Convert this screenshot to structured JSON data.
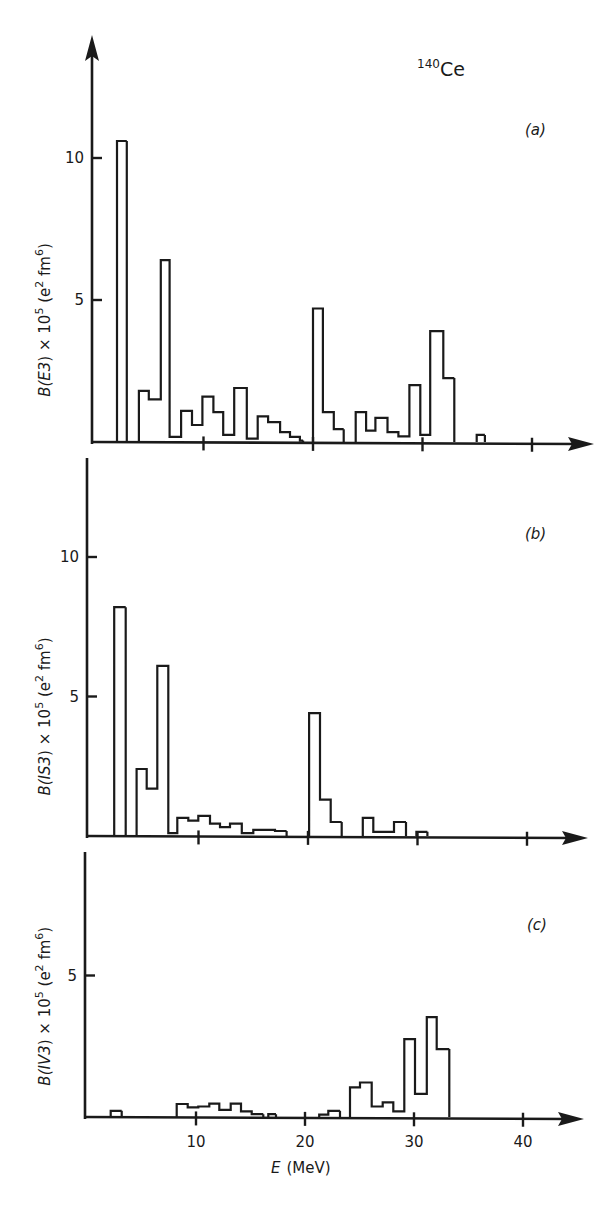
{
  "figure": {
    "nucleus_mass": "140",
    "nucleus_symbol": "Ce",
    "xlabel_symbol": "E",
    "xlabel_unit": "(MeV)",
    "ink_color": "#1a1a1a",
    "background": "#ffffff"
  },
  "chart_data": [
    {
      "type": "bar",
      "subtype": "histogram-step",
      "panel": "(a)",
      "title": "140Ce",
      "ylabel": "B(E3) × 10^5 (e^2 fm^6)",
      "ylabel_parts": {
        "pre": "B(",
        "op": "E3",
        "mid": ") × 10",
        "exp1": "5",
        "post1": " (e",
        "exp2": "2",
        "post2": " fm",
        "exp3": "6",
        "end": ")"
      },
      "xlabel": "E (MeV)",
      "xlim": [
        0,
        45
      ],
      "ylim": [
        0,
        12.5
      ],
      "yticks": [
        5,
        10
      ],
      "xticks": [
        10,
        20,
        30,
        40
      ],
      "xtick_labels_shown": false,
      "layout": {
        "x0": 94,
        "pxPerE": 10.95,
        "y0": 442,
        "pxPerY": 28.4,
        "yTop": 35,
        "xEnd": 594
      },
      "bins": [
        {
          "from": 2.1,
          "to": 3.0,
          "value": 10.6
        },
        {
          "from": 4.1,
          "to": 5.0,
          "value": 1.8
        },
        {
          "from": 5.0,
          "to": 6.1,
          "value": 1.5
        },
        {
          "from": 6.1,
          "to": 6.9,
          "value": 6.4
        },
        {
          "from": 6.9,
          "to": 7.95,
          "value": 0.18
        },
        {
          "from": 7.95,
          "to": 8.95,
          "value": 1.1
        },
        {
          "from": 8.95,
          "to": 9.9,
          "value": 0.6
        },
        {
          "from": 9.9,
          "to": 10.9,
          "value": 1.6
        },
        {
          "from": 10.9,
          "to": 11.8,
          "value": 1.05
        },
        {
          "from": 11.8,
          "to": 12.8,
          "value": 0.25
        },
        {
          "from": 12.8,
          "to": 13.95,
          "value": 1.9
        },
        {
          "from": 13.95,
          "to": 14.95,
          "value": 0.12
        },
        {
          "from": 14.95,
          "to": 15.9,
          "value": 0.9
        },
        {
          "from": 15.9,
          "to": 17.0,
          "value": 0.7
        },
        {
          "from": 17.0,
          "to": 17.9,
          "value": 0.35
        },
        {
          "from": 17.9,
          "to": 18.8,
          "value": 0.18
        },
        {
          "from": 18.8,
          "to": 19.1,
          "value": 0.05
        },
        {
          "from": 20.0,
          "to": 20.9,
          "value": 4.7
        },
        {
          "from": 20.9,
          "to": 21.9,
          "value": 1.05
        },
        {
          "from": 21.9,
          "to": 22.8,
          "value": 0.45
        },
        {
          "from": 23.9,
          "to": 24.85,
          "value": 1.05
        },
        {
          "from": 24.85,
          "to": 25.7,
          "value": 0.4
        },
        {
          "from": 25.7,
          "to": 26.8,
          "value": 0.85
        },
        {
          "from": 26.8,
          "to": 27.8,
          "value": 0.35
        },
        {
          "from": 27.8,
          "to": 28.8,
          "value": 0.2
        },
        {
          "from": 28.8,
          "to": 29.8,
          "value": 2.0
        },
        {
          "from": 29.8,
          "to": 30.7,
          "value": 0.25
        },
        {
          "from": 30.7,
          "to": 31.9,
          "value": 3.9
        },
        {
          "from": 31.9,
          "to": 32.9,
          "value": 2.25
        },
        {
          "from": 34.95,
          "to": 35.7,
          "value": 0.25
        }
      ]
    },
    {
      "type": "bar",
      "subtype": "histogram-step",
      "panel": "(b)",
      "ylabel": "B(IS3) × 10^5 (e^2 fm^6)",
      "ylabel_parts": {
        "pre": "B(",
        "op": "IS3",
        "mid": ") × 10",
        "exp1": "5",
        "post1": " (e",
        "exp2": "2",
        "post2": " fm",
        "exp3": "6",
        "end": ")"
      },
      "xlabel": "E (MeV)",
      "xlim": [
        0,
        45
      ],
      "ylim": [
        0,
        12.5
      ],
      "yticks": [
        5,
        10
      ],
      "xticks": [
        10,
        20,
        30,
        40
      ],
      "xtick_labels_shown": false,
      "layout": {
        "x0": 89,
        "pxPerE": 10.95,
        "y0": 836,
        "pxPerY": 27.9,
        "yTop": 444,
        "xEnd": 588
      },
      "bins": [
        {
          "from": 2.3,
          "to": 3.35,
          "value": 8.2
        },
        {
          "from": 4.35,
          "to": 5.27,
          "value": 2.4
        },
        {
          "from": 5.27,
          "to": 6.24,
          "value": 1.7
        },
        {
          "from": 6.24,
          "to": 7.24,
          "value": 6.1
        },
        {
          "from": 7.24,
          "to": 8.06,
          "value": 0.1
        },
        {
          "from": 8.06,
          "to": 9.07,
          "value": 0.65
        },
        {
          "from": 9.07,
          "to": 9.98,
          "value": 0.55
        },
        {
          "from": 9.98,
          "to": 11.05,
          "value": 0.72
        },
        {
          "from": 11.05,
          "to": 11.96,
          "value": 0.44
        },
        {
          "from": 11.96,
          "to": 12.88,
          "value": 0.32
        },
        {
          "from": 12.88,
          "to": 13.95,
          "value": 0.44
        },
        {
          "from": 13.95,
          "to": 15.0,
          "value": 0.1
        },
        {
          "from": 15.0,
          "to": 16.99,
          "value": 0.22
        },
        {
          "from": 16.99,
          "to": 18.05,
          "value": 0.18
        },
        {
          "from": 20.1,
          "to": 21.1,
          "value": 4.4
        },
        {
          "from": 21.1,
          "to": 22.07,
          "value": 1.3
        },
        {
          "from": 22.07,
          "to": 23.08,
          "value": 0.5
        },
        {
          "from": 25.0,
          "to": 25.96,
          "value": 0.65
        },
        {
          "from": 25.96,
          "to": 27.85,
          "value": 0.15
        },
        {
          "from": 27.85,
          "to": 28.95,
          "value": 0.5
        },
        {
          "from": 29.9,
          "to": 30.9,
          "value": 0.15
        }
      ]
    },
    {
      "type": "bar",
      "subtype": "histogram-step",
      "panel": "(c)",
      "ylabel": "B(IV3) × 10^5 (e^2 fm^6)",
      "ylabel_parts": {
        "pre": "B(",
        "op": "IV3",
        "mid": ") × 10",
        "exp1": "5",
        "post1": " (e",
        "exp2": "2",
        "post2": " fm",
        "exp3": "6",
        "end": ")"
      },
      "xlabel": "E (MeV)",
      "xlim": [
        0,
        45
      ],
      "ylim": [
        0,
        9.5
      ],
      "yticks": [
        5
      ],
      "xticks": [
        10,
        20,
        30,
        40
      ],
      "xtick_labels": [
        "10",
        "20",
        "30",
        "40"
      ],
      "xtick_labels_shown": true,
      "layout": {
        "x0": 87,
        "pxPerE": 10.9,
        "y0": 1117,
        "pxPerY": 28.3,
        "yTop": 838,
        "xEnd": 584
      },
      "bins": [
        {
          "from": 2.17,
          "to": 3.18,
          "value": 0.22
        },
        {
          "from": 8.23,
          "to": 9.24,
          "value": 0.46
        },
        {
          "from": 9.24,
          "to": 10.21,
          "value": 0.34
        },
        {
          "from": 10.21,
          "to": 11.22,
          "value": 0.37
        },
        {
          "from": 11.22,
          "to": 12.14,
          "value": 0.47
        },
        {
          "from": 12.14,
          "to": 13.18,
          "value": 0.25
        },
        {
          "from": 13.18,
          "to": 14.13,
          "value": 0.47
        },
        {
          "from": 14.13,
          "to": 15.11,
          "value": 0.2
        },
        {
          "from": 15.11,
          "to": 16.17,
          "value": 0.1
        },
        {
          "from": 16.63,
          "to": 17.34,
          "value": 0.1
        },
        {
          "from": 21.3,
          "to": 22.14,
          "value": 0.08
        },
        {
          "from": 22.14,
          "to": 23.21,
          "value": 0.22
        },
        {
          "from": 24.13,
          "to": 25.05,
          "value": 1.05
        },
        {
          "from": 25.05,
          "to": 26.12,
          "value": 1.22
        },
        {
          "from": 26.12,
          "to": 27.13,
          "value": 0.37
        },
        {
          "from": 27.13,
          "to": 28.1,
          "value": 0.52
        },
        {
          "from": 28.1,
          "to": 29.11,
          "value": 0.2
        },
        {
          "from": 29.11,
          "to": 30.09,
          "value": 2.75
        },
        {
          "from": 30.09,
          "to": 31.17,
          "value": 0.82
        },
        {
          "from": 31.17,
          "to": 32.08,
          "value": 3.53
        },
        {
          "from": 32.08,
          "to": 33.24,
          "value": 2.4
        }
      ]
    }
  ]
}
